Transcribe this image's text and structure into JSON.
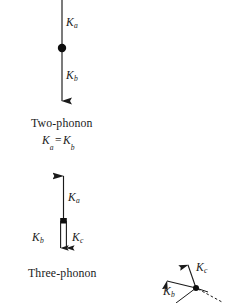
{
  "figure": {
    "background_color": "#ffffff",
    "ink_color": "#1a1a1a",
    "diagrams": [
      {
        "id": "two-phonon",
        "caption": "Two-phonon",
        "equation": {
          "lhs": "K",
          "lhs_sub": "a",
          "operator": "=",
          "rhs": "K",
          "rhs_sub": "b"
        },
        "vectors": [
          {
            "name": "K",
            "subscript": "a",
            "label_x": 66,
            "label_y": 17,
            "direction": "down",
            "arrowhead": false
          },
          {
            "name": "K",
            "subscript": "b",
            "label_x": 66,
            "label_y": 70,
            "direction": "down",
            "arrowhead": true
          }
        ],
        "node": {
          "x": 62,
          "y": 48,
          "radius": 4.2
        },
        "axis": {
          "x": 62,
          "top": 0,
          "bottom": 111
        },
        "caption_x": 31,
        "caption_y": 124,
        "equation_x": 42,
        "equation_y": 140
      },
      {
        "id": "three-phonon",
        "caption": "Three-phonon",
        "vectors": [
          {
            "name": "K",
            "subscript": "a",
            "label_x": 68,
            "label_y": 192,
            "direction": "up",
            "arrowhead": true
          },
          {
            "name": "K",
            "subscript": "b",
            "label_x": 35,
            "label_y": 238,
            "direction": "down",
            "arrowhead": true
          },
          {
            "name": "K",
            "subscript": "c",
            "label_x": 71,
            "label_y": 238,
            "direction": "down",
            "arrowhead": true
          }
        ],
        "node": {
          "x": 63,
          "y": 221,
          "radius": 3.6
        },
        "caption_x": 28,
        "caption_y": 274
      },
      {
        "id": "momentum-vector-triad",
        "vectors": [
          {
            "name": "K",
            "subscript": "c",
            "label_x": 201,
            "label_y": 268,
            "direction": "up-right",
            "arrowhead": true
          },
          {
            "name": "K",
            "subscript": "b",
            "label_x": 166,
            "label_y": 288,
            "direction": "up-left",
            "arrowhead": true
          }
        ],
        "node": {
          "x": 196,
          "y": 288,
          "radius": 3.0
        },
        "dashed_ray": {
          "from_x": 198,
          "from_y": 289,
          "to_x": 222,
          "to_y": 301
        }
      }
    ]
  }
}
